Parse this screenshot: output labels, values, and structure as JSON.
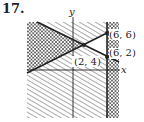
{
  "problem_number": "17.",
  "axes": {
    "x_label": "x",
    "y_label": "y"
  },
  "points": [
    {
      "label": "(2, 4)",
      "x": 2,
      "y": 4
    },
    {
      "label": "(6, 6)",
      "x": 6,
      "y": 6
    },
    {
      "label": "(6, 2)",
      "x": 6,
      "y": 2
    }
  ],
  "boundary_lines": [
    {
      "description": "descending line through (2,4) and (6,2)"
    },
    {
      "description": "ascending line through (2,4) and (6,6)"
    },
    {
      "description": "vertical line x = 6"
    }
  ],
  "feasible_region": "unshaded triangle with vertices (2,4), (6,6), (6,2)",
  "colors": {
    "line": "#222222",
    "hatch": "#555555",
    "background": "#ffffff"
  }
}
